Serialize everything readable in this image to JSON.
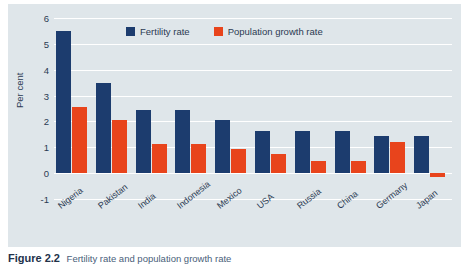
{
  "chart_data": {
    "type": "bar",
    "title": "",
    "xlabel": "",
    "ylabel": "Per cent",
    "ylim": [
      -1,
      6
    ],
    "yticks": [
      6,
      5,
      4,
      3,
      2,
      1,
      0,
      -1
    ],
    "ytick_labels": [
      "6",
      "5",
      "4",
      "3",
      "2",
      "1",
      "0",
      "-1"
    ],
    "grid": true,
    "legend_position": "top-center",
    "categories": [
      "Nigeria",
      "Pakistan",
      "India",
      "Indonesia",
      "Mexico",
      "USA",
      "Russia",
      "China",
      "Germany",
      "Japan"
    ],
    "series": [
      {
        "name": "Fertility rate",
        "color": "#1c3c6e",
        "values": [
          5.5,
          3.5,
          2.45,
          2.45,
          2.05,
          1.62,
          1.62,
          1.62,
          1.45,
          1.43
        ]
      },
      {
        "name": "Population growth rate",
        "color": "#e8441c",
        "values": [
          2.55,
          2.05,
          1.12,
          1.12,
          0.95,
          0.75,
          0.47,
          0.47,
          1.22,
          -0.15
        ]
      }
    ]
  },
  "legend": {
    "items": [
      {
        "label": "Fertility rate",
        "color": "#1c3c6e"
      },
      {
        "label": "Population growth rate",
        "color": "#e8441c"
      }
    ]
  },
  "caption": {
    "number": "Figure 2.2",
    "text": "Fertility rate and population growth rate"
  },
  "colors": {
    "panel_background": "#dfe6ea",
    "gridline": "#ffffff",
    "text": "#2b3a52",
    "fertility": "#1c3c6e",
    "growth": "#e8441c"
  }
}
